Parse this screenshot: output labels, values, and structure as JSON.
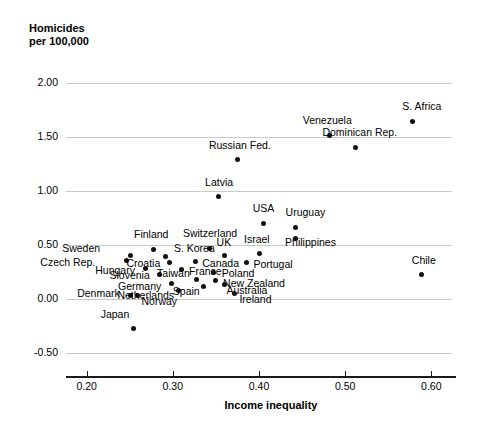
{
  "chart_data": {
    "type": "scatter",
    "title": "Homicides\nper 100,000",
    "xlabel": "Income inequality",
    "ylabel": "Homicides per 100,000",
    "xlim": [
      0.176,
      0.624
    ],
    "ylim": [
      -0.69,
      2.17
    ],
    "xticks": [
      "0.20",
      "0.30",
      "0.40",
      "0.50",
      "0.60"
    ],
    "xtick_values": [
      0.2,
      0.3,
      0.4,
      0.5,
      0.6
    ],
    "yticks": [
      "2.00",
      "1.50",
      "1.00",
      "0.50",
      "0.00",
      "-0.50"
    ],
    "ytick_values": [
      2.0,
      1.5,
      1.0,
      0.5,
      0.0,
      -0.5
    ],
    "grid": "horizontal",
    "legend": "none",
    "points": [
      {
        "label": "S. Africa",
        "x": 0.5785,
        "y": 1.646,
        "lx": 9,
        "ly": -15,
        "anchor": "center"
      },
      {
        "label": "Venezuela",
        "x": 0.4815,
        "y": 1.515,
        "lx": -2,
        "ly": -15,
        "anchor": "center"
      },
      {
        "label": "Dominican Rep.",
        "x": 0.5125,
        "y": 1.405,
        "lx": 4,
        "ly": -15,
        "anchor": "center"
      },
      {
        "label": "Russian Fed.",
        "x": 0.3755,
        "y": 1.29,
        "lx": 2,
        "ly": -15,
        "anchor": "center"
      },
      {
        "label": "Latvia",
        "x": 0.3525,
        "y": 0.945,
        "lx": 1,
        "ly": -15,
        "anchor": "center"
      },
      {
        "label": "USA",
        "x": 0.4055,
        "y": 0.7,
        "lx": 0,
        "ly": -15,
        "anchor": "center"
      },
      {
        "label": "Uruguay",
        "x": 0.4425,
        "y": 0.665,
        "lx": 10,
        "ly": -15,
        "anchor": "center"
      },
      {
        "label": "Philippines",
        "x": 0.4425,
        "y": 0.56,
        "lx": 15,
        "ly": 3,
        "anchor": "center"
      },
      {
        "label": "Chile",
        "x": 0.589,
        "y": 0.225,
        "lx": 2,
        "ly": -15,
        "anchor": "center"
      },
      {
        "label": "Israel",
        "x": 0.4,
        "y": 0.425,
        "lx": -2,
        "ly": -14,
        "anchor": "center"
      },
      {
        "label": "Switzerland",
        "x": 0.343,
        "y": 0.47,
        "lx": 0,
        "ly": -15,
        "anchor": "center"
      },
      {
        "label": "Finland",
        "x": 0.277,
        "y": 0.46,
        "lx": -2,
        "ly": -15,
        "anchor": "center"
      },
      {
        "label": "Sweden",
        "x": 0.2505,
        "y": 0.4,
        "lx": -30,
        "ly": -8,
        "anchor": "right"
      },
      {
        "label": "Czech Rep.",
        "x": 0.246,
        "y": 0.355,
        "lx": -31,
        "ly": 1,
        "anchor": "right"
      },
      {
        "label": "S. Korea",
        "x": 0.292,
        "y": 0.395,
        "lx": 8,
        "ly": -8,
        "anchor": "left"
      },
      {
        "label": "Croatia",
        "x": 0.296,
        "y": 0.34,
        "lx": -9,
        "ly": 1,
        "anchor": "right"
      },
      {
        "label": "Canada",
        "x": 0.326,
        "y": 0.345,
        "lx": 7,
        "ly": 1,
        "anchor": "left"
      },
      {
        "label": "UK",
        "x": 0.3595,
        "y": 0.4,
        "lx": 0,
        "ly": -14,
        "anchor": "center"
      },
      {
        "label": "Portugal",
        "x": 0.3855,
        "y": 0.34,
        "lx": 7,
        "ly": 2,
        "anchor": "left"
      },
      {
        "label": "Hungary",
        "x": 0.268,
        "y": 0.28,
        "lx": -10,
        "ly": 1,
        "anchor": "right"
      },
      {
        "label": "France",
        "x": 0.3095,
        "y": 0.27,
        "lx": 8,
        "ly": 1,
        "anchor": "left"
      },
      {
        "label": "Poland",
        "x": 0.3475,
        "y": 0.25,
        "lx": 8,
        "ly": 1,
        "anchor": "left"
      },
      {
        "label": "Slovenia",
        "x": 0.2845,
        "y": 0.23,
        "lx": -10,
        "ly": 1,
        "anchor": "right"
      },
      {
        "label": "Taiwan",
        "x": 0.327,
        "y": 0.18,
        "lx": -6,
        "ly": -7,
        "anchor": "right"
      },
      {
        "label": "New Zealand",
        "x": 0.349,
        "y": 0.17,
        "lx": 8,
        "ly": 2,
        "anchor": "left"
      },
      {
        "label": "Germany",
        "x": 0.298,
        "y": 0.145,
        "lx": -10,
        "ly": 3,
        "anchor": "right"
      },
      {
        "label": "Spain",
        "x": 0.336,
        "y": 0.115,
        "lx": -4,
        "ly": 4,
        "anchor": "right"
      },
      {
        "label": "Australia",
        "x": 0.36,
        "y": 0.13,
        "lx": 2,
        "ly": 5,
        "anchor": "left"
      },
      {
        "label": "Denmark",
        "x": 0.2505,
        "y": 0.035,
        "lx": -10,
        "ly": -2,
        "anchor": "right"
      },
      {
        "label": "Netherlands",
        "x": 0.3065,
        "y": 0.075,
        "lx": -4,
        "ly": 4,
        "anchor": "right"
      },
      {
        "label": "Norway",
        "x": 0.259,
        "y": 0.03,
        "lx": 4,
        "ly": 5,
        "anchor": "left"
      },
      {
        "label": "Ireland",
        "x": 0.3715,
        "y": 0.055,
        "lx": 5,
        "ly": 6,
        "anchor": "left"
      },
      {
        "label": "Japan",
        "x": 0.2545,
        "y": -0.27,
        "lx": -4,
        "ly": -14,
        "anchor": "right"
      }
    ]
  }
}
